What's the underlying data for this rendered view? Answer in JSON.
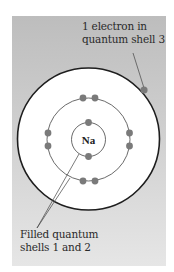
{
  "diagram": {
    "nucleus": {
      "symbol": "Na"
    },
    "shells": [
      {
        "number": 1,
        "electrons": 2
      },
      {
        "number": 2,
        "electrons": 8
      },
      {
        "number": 3,
        "electrons": 1
      }
    ],
    "labels": {
      "top": {
        "line1": "1 electron in",
        "line2": "quantum shell 3"
      },
      "bottom": {
        "line1": "Filled quantum",
        "line2": "shells 1 and 2"
      }
    },
    "colors": {
      "panel_top": "#bdbdbd",
      "panel_bottom": "#e6e6e6",
      "atom_fill": "#ffffff",
      "shell_stroke": "#333333",
      "electron": "#7a7a7a"
    }
  }
}
